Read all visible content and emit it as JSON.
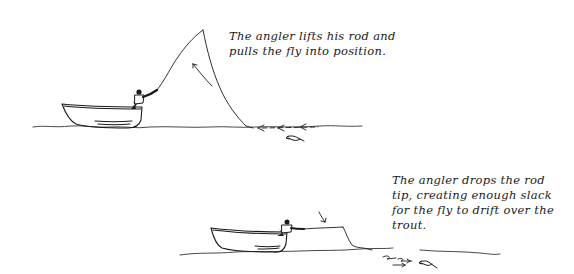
{
  "panels": [
    {
      "id": "lift",
      "caption": "The angler lifts his rod and pulls the fly into position.",
      "caption_lines": [
        "The angler lifts his rod and",
        "pulls the fly into position."
      ]
    },
    {
      "id": "drop",
      "caption": "The angler drops the rod tip, creating enough slack for the fly to drift over the trout.",
      "caption_lines": [
        "The angler drops the rod",
        "tip, creating enough slack",
        "for the fly to drift over the",
        "trout."
      ]
    }
  ],
  "colors": {
    "ink": "#1a1a1a",
    "background": "#ffffff"
  }
}
